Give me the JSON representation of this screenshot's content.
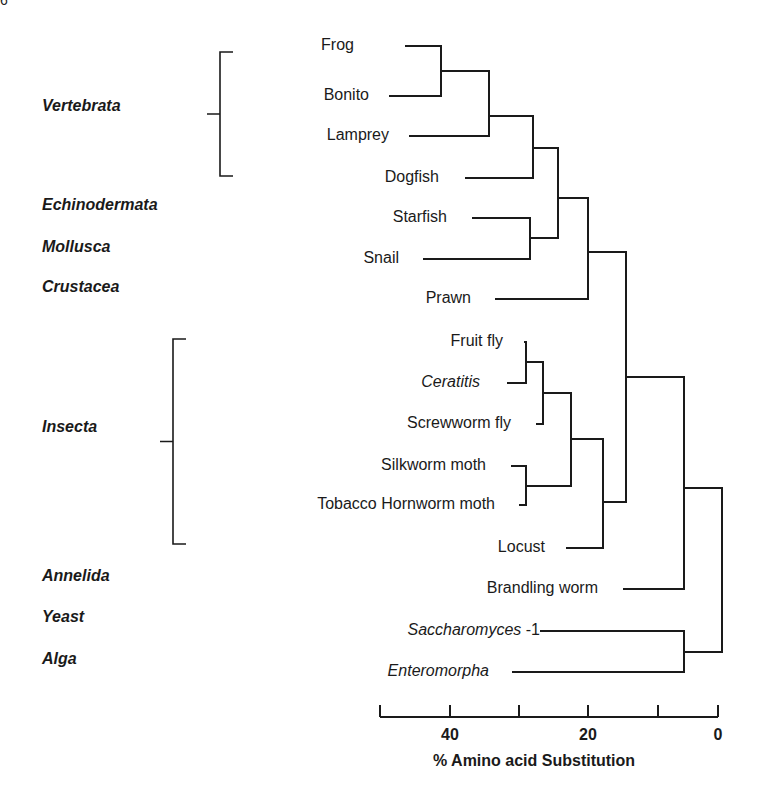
{
  "corner_mark": "6",
  "groups": [
    {
      "name": "Vertebrata",
      "y": 106,
      "bracket": {
        "x": 220,
        "top": 52,
        "bottom": 176,
        "stub_left": 207
      }
    },
    {
      "name": "Echinodermata",
      "y": 205
    },
    {
      "name": "Mollusca",
      "y": 247
    },
    {
      "name": "Crustacea",
      "y": 287
    },
    {
      "name": "Insecta",
      "y": 427,
      "bracket": {
        "x": 173,
        "top": 339,
        "bottom": 544,
        "stub_left": 160
      }
    },
    {
      "name": "Annelida",
      "y": 576
    },
    {
      "name": "Yeast",
      "y": 617
    },
    {
      "name": "Alga",
      "y": 659
    }
  ],
  "leaves": [
    {
      "label": "Frog",
      "italic": false,
      "suffix": "",
      "y": 46,
      "text_right": 354,
      "line_start": 405
    },
    {
      "label": "Bonito",
      "italic": false,
      "suffix": "",
      "y": 96,
      "text_right": 369,
      "line_start": 389
    },
    {
      "label": "Lamprey",
      "italic": false,
      "suffix": "",
      "y": 136,
      "text_right": 389,
      "line_start": 409
    },
    {
      "label": "Dogfish",
      "italic": false,
      "suffix": "",
      "y": 178,
      "text_right": 439,
      "line_start": 465
    },
    {
      "label": "Starfish",
      "italic": false,
      "suffix": "",
      "y": 218,
      "text_right": 447,
      "line_start": 472
    },
    {
      "label": "Snail",
      "italic": false,
      "suffix": "",
      "y": 259,
      "text_right": 399,
      "line_start": 423
    },
    {
      "label": "Prawn",
      "italic": false,
      "suffix": "",
      "y": 299,
      "text_right": 471,
      "line_start": 495
    },
    {
      "label": "Fruit fly",
      "italic": false,
      "suffix": "",
      "y": 342,
      "text_right": 503,
      "line_start": 524
    },
    {
      "label": "Ceratitis",
      "italic": true,
      "suffix": "",
      "y": 383,
      "text_right": 480,
      "line_start": 507
    },
    {
      "label": "Screwworm fly",
      "italic": false,
      "suffix": "",
      "y": 424,
      "text_right": 511,
      "line_start": 536
    },
    {
      "label": "Silkworm moth",
      "italic": false,
      "suffix": "",
      "y": 466,
      "text_right": 486,
      "line_start": 511
    },
    {
      "label": "Tobacco Hornworm moth",
      "italic": false,
      "suffix": "",
      "y": 505,
      "text_right": 495,
      "line_start": 519
    },
    {
      "label": "Locust",
      "italic": false,
      "suffix": "",
      "y": 548,
      "text_right": 545,
      "line_start": 566
    },
    {
      "label": "Brandling worm",
      "italic": false,
      "suffix": "",
      "y": 589,
      "text_right": 598,
      "line_start": 623
    },
    {
      "label": "Saccharomyces",
      "italic": true,
      "suffix": " -1",
      "y": 631,
      "text_right": 540,
      "line_start": 540
    },
    {
      "label": "Enteromorpha",
      "italic": true,
      "suffix": "",
      "y": 672,
      "text_right": 489,
      "line_start": 512
    }
  ],
  "axis": {
    "title": "% Amino acid Substitution",
    "baseline_y": 717,
    "left_x": 380,
    "right_x": 718,
    "ticks": [
      {
        "x": 380,
        "label": ""
      },
      {
        "x": 450,
        "label": "40"
      },
      {
        "x": 519,
        "label": ""
      },
      {
        "x": 588,
        "label": "20"
      },
      {
        "x": 658,
        "label": ""
      },
      {
        "x": 718,
        "label": "0"
      }
    ],
    "tick_label_y": 726,
    "title_x": 433,
    "title_y": 752
  },
  "chart_data": {
    "type": "dendrogram",
    "title": "",
    "xlabel": "% Amino acid Substitution",
    "xlim": [
      49,
      0
    ],
    "x_ticks": [
      40,
      20,
      0
    ],
    "minor_ticks": [
      49,
      30,
      10
    ],
    "leaves": [
      "Frog",
      "Bonito",
      "Lamprey",
      "Dogfish",
      "Starfish",
      "Snail",
      "Prawn",
      "Fruit fly",
      "Ceratitis",
      "Screwworm fly",
      "Silkworm moth",
      "Tobacco Hornworm moth",
      "Locust",
      "Brandling worm",
      "Saccharomyces -1",
      "Enteromorpha"
    ],
    "groups": {
      "Vertebrata": [
        "Frog",
        "Bonito",
        "Lamprey",
        "Dogfish"
      ],
      "Echinodermata": [
        "Starfish"
      ],
      "Mollusca": [
        "Snail"
      ],
      "Crustacea": [
        "Prawn"
      ],
      "Insecta": [
        "Fruit fly",
        "Ceratitis",
        "Screwworm fly",
        "Silkworm moth",
        "Tobacco Hornworm moth",
        "Locust"
      ],
      "Annelida": [
        "Brandling worm"
      ],
      "Yeast": [
        "Saccharomyces -1"
      ],
      "Alga": [
        "Enteromorpha"
      ]
    },
    "merges": [
      {
        "members": [
          "Frog",
          "Bonito"
        ],
        "distance": 40
      },
      {
        "members": [
          "Frog+Bonito",
          "Lamprey"
        ],
        "distance": 33
      },
      {
        "members": [
          "Frog+Bonito+Lamprey",
          "Dogfish"
        ],
        "distance": 27
      },
      {
        "members": [
          "Starfish",
          "Snail"
        ],
        "distance": 27
      },
      {
        "members": [
          "Vertebrata",
          "Starfish+Snail"
        ],
        "distance": 23
      },
      {
        "members": [
          "Vertebrata+Starfish+Snail",
          "Prawn"
        ],
        "distance": 19
      },
      {
        "members": [
          "Fruit fly",
          "Ceratitis"
        ],
        "distance": 28
      },
      {
        "members": [
          "Fruit fly+Ceratitis",
          "Screwworm fly"
        ],
        "distance": 25
      },
      {
        "members": [
          "Silkworm moth",
          "Tobacco Hornworm moth"
        ],
        "distance": 28
      },
      {
        "members": [
          "Diptera",
          "Lepidoptera"
        ],
        "distance": 21
      },
      {
        "members": [
          "Diptera+Lepidoptera",
          "Locust"
        ],
        "distance": 17
      },
      {
        "members": [
          "Deuterostome+Mollusca+Crustacea",
          "Insecta"
        ],
        "distance": 13
      },
      {
        "members": [
          "Animals",
          "Brandling worm"
        ],
        "distance": 5
      },
      {
        "members": [
          "Saccharomyces -1",
          "Enteromorpha"
        ],
        "distance": 5
      },
      {
        "members": [
          "Animals+Annelida",
          "Yeast+Alga"
        ],
        "distance": 0
      }
    ]
  },
  "tree_lines": [
    "M405 46 H441 V96 H389",
    "M441 71 H489 V136 H409",
    "M489 116 H533 V178 H465",
    "M472 218 H530 V259 H423",
    "M533 148 H558 V238 H530",
    "M558 198 H588 V299 H495",
    "M524 342 H526 V383 H507",
    "M526 362 H543 V424 H536",
    "M511 466 H526 V505 H519",
    "M543 393 H571 V486 H526",
    "M571 439 H603 V548 H566",
    "M588 252 H626 V502 H603",
    "M626 377 H684 V589 H623",
    "M540 631 H684 V672 H512",
    "M684 488 H722 V652 H684"
  ],
  "colors": {
    "ink": "#1a1a1a",
    "background": "#ffffff"
  }
}
